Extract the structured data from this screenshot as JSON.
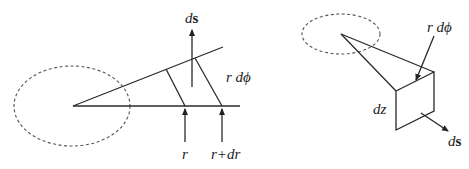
{
  "left_figure": {
    "labels": {
      "ds_prefix": "d",
      "ds_vector": "s",
      "r_dphi": "r dϕ",
      "r": "r",
      "r_plus_dr": "r+dr"
    }
  },
  "right_figure": {
    "labels": {
      "r_dphi": "r dϕ",
      "dz": "dz",
      "ds_prefix": "d",
      "ds_vector": "s"
    }
  },
  "colors": {
    "line": "#2a2a2a",
    "dashed": "#555555",
    "background": "#ffffff"
  }
}
